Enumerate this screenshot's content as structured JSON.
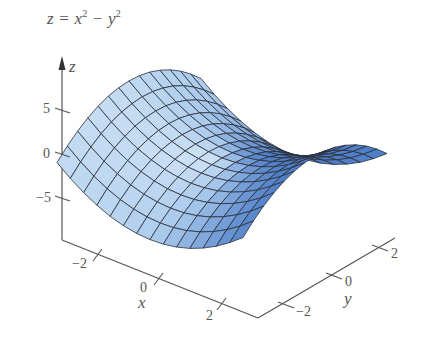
{
  "title": {
    "lhs": "z = x",
    "exp1": "2",
    "mid": " − y",
    "exp2": "2",
    "full": "z = x² − y²"
  },
  "colors": {
    "surface_light": "#d6e8f7",
    "surface_mid": "#a9c9ec",
    "surface_dark": "#4f7fc8",
    "mesh": "#2a2f3a",
    "axis": "#555555",
    "text": "#555555"
  },
  "chart_data": {
    "type": "surface3d",
    "function": "z = x^2 - y^2",
    "xlabel": "x",
    "ylabel": "y",
    "zlabel": "z",
    "x_range": [
      -3,
      3
    ],
    "y_range": [
      -3,
      3
    ],
    "z_ticks": [
      5,
      0,
      -5
    ],
    "z_tick_labels": [
      "5",
      "0",
      "−5"
    ],
    "x_ticks": [
      -2,
      0,
      2
    ],
    "x_tick_labels": [
      "−2",
      "0",
      "2"
    ],
    "y_ticks": [
      -2,
      0,
      2
    ],
    "y_tick_labels": [
      "−2",
      "0",
      "2"
    ],
    "grid_lines_per_side": 14,
    "grid": false,
    "legend": "none"
  }
}
